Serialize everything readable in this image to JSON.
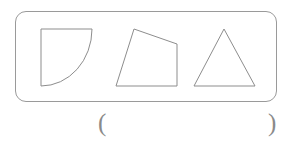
{
  "page": {
    "background_color": "#ffffff",
    "stroke_color": "#8d8d8d",
    "border_color": "#9a9a9a",
    "text_color": "#8a8a8a"
  },
  "figure_panel": {
    "name": "shape-group-box",
    "shapes": [
      {
        "id": "shape-1",
        "name": "quarter-circle",
        "label": "quarter circle sector",
        "path": "M 41 29 L 92 29 L 92 29 A 51 57 0 0 1 41 86 L 41 86 Z",
        "description": "square corner at top-left with an arc sweeping from the top-right corner down to the bottom-left corner"
      },
      {
        "id": "shape-2",
        "name": "quadrilateral",
        "label": "irregular quadrilateral",
        "path": "M 134 29 L 177 44 L 177 86 L 116 86 Z",
        "description": "four sided figure with flat bottom edge, vertical right edge, slanted top edge and slanted left edge"
      },
      {
        "id": "shape-3",
        "name": "triangle",
        "label": "triangle",
        "path": "M 224 29 L 255 86 L 194 86 Z",
        "description": "isosceles triangle with apex at top and horizontal base"
      }
    ]
  },
  "answer": {
    "open_paren": "(",
    "close_paren": ")",
    "value": "",
    "placeholder": ""
  }
}
